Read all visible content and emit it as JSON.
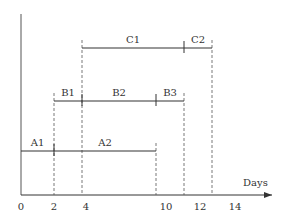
{
  "diagram": {
    "type": "schedule-timeline",
    "axis": {
      "x_label": "Days",
      "ticks": [
        {
          "value": 0,
          "label": "0"
        },
        {
          "value": 2,
          "label": "2"
        },
        {
          "value": 4,
          "label": "4"
        },
        {
          "value": 10,
          "label": "10"
        },
        {
          "value": 12,
          "label": "12"
        },
        {
          "value": 14,
          "label": "14"
        }
      ]
    },
    "rows": [
      {
        "name": "A",
        "start": 0,
        "end": 9.5,
        "segments": [
          {
            "label": "A1",
            "start": 0,
            "end": 2
          },
          {
            "label": "A2",
            "start": 2,
            "end": 9.5
          }
        ]
      },
      {
        "name": "B",
        "start": 2,
        "end": 11.2,
        "segments": [
          {
            "label": "B1",
            "start": 2,
            "end": 3.8
          },
          {
            "label": "B2",
            "start": 3.8,
            "end": 9.5
          },
          {
            "label": "B3",
            "start": 9.5,
            "end": 11.2
          }
        ]
      },
      {
        "name": "C",
        "start": 3.8,
        "end": 12.8,
        "segments": [
          {
            "label": "C1",
            "start": 3.8,
            "end": 11.2
          },
          {
            "label": "C2",
            "start": 11.2,
            "end": 12.8
          }
        ]
      }
    ],
    "colors": {
      "line": "#333333",
      "dashed": "#555555"
    }
  }
}
